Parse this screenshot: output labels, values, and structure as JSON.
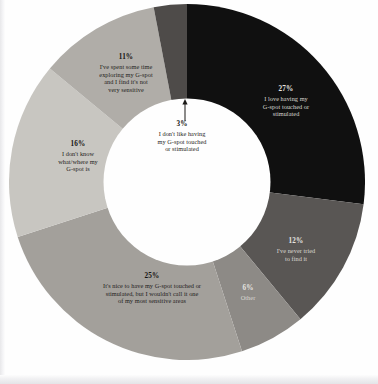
{
  "page": {
    "background_color": "#fefefe",
    "type": "scanned-book-page"
  },
  "chart_data": {
    "type": "pie",
    "variant": "donut",
    "title": "",
    "subtitle": "",
    "xlabel": "",
    "ylabel": "",
    "legend_position": "none",
    "labels_inside_slices": true,
    "start_angle_deg": 0,
    "direction": "clockwise",
    "inner_radius_ratio": 0.47,
    "units": "percent",
    "categories": [
      "I love having my G-spot touched or stimulated",
      "I've never tried to find it",
      "Other",
      "It's nice to have my G-spot touched or stimulated, but I wouldn't call it one of my most sensitive areas",
      "I don't know what/where my G-spot is",
      "I've spent some time exploring my G-spot and I find it's not very sensitive",
      "I don't like having my G-spot touched or stimulated"
    ],
    "values": [
      27,
      12,
      6,
      25,
      16,
      11,
      3
    ],
    "colors": [
      "#101010",
      "#595654",
      "#8d8a86",
      "#a3a09b",
      "#c8c6c1",
      "#b0ada8",
      "#4e4b49"
    ],
    "slices": [
      {
        "id": "slice-love",
        "percent_label": "27%",
        "value": 27,
        "lines": [
          "I love having my",
          "G-spot touched or",
          "stimulated"
        ],
        "color": "#101010",
        "text_color": "#d9d7d2"
      },
      {
        "id": "slice-never-tried",
        "percent_label": "12%",
        "value": 12,
        "lines": [
          "I've never tried",
          "to find it"
        ],
        "color": "#595654",
        "text_color": "#cfcdc9"
      },
      {
        "id": "slice-other",
        "percent_label": "6%",
        "value": 6,
        "lines": [
          "Other"
        ],
        "color": "#8d8a86",
        "text_color": "#ebeae7"
      },
      {
        "id": "slice-nice",
        "percent_label": "25%",
        "value": 25,
        "lines": [
          "It's nice to have my G-spot touched or",
          "stimulated, but I wouldn't call it one",
          "of my most sensitive areas"
        ],
        "color": "#a3a09b",
        "text_color": "#1f1d1b"
      },
      {
        "id": "slice-dont-know",
        "percent_label": "16%",
        "value": 16,
        "lines": [
          "I don't know",
          "what/where my",
          "G-spot is"
        ],
        "color": "#c8c6c1",
        "text_color": "#1f1d1b"
      },
      {
        "id": "slice-not-sensitive",
        "percent_label": "11%",
        "value": 11,
        "lines": [
          "I've spent some time",
          "exploring my G-spot",
          "and I find it's not",
          "very sensitive"
        ],
        "color": "#b0ada8",
        "text_color": "#1f1d1b"
      },
      {
        "id": "slice-dont-like",
        "percent_label": "3%",
        "value": 3,
        "lines": [
          "I don't like having",
          "my G-spot touched",
          "or stimulated"
        ],
        "color": "#4e4b49",
        "text_color": "#1f1d1b",
        "callout": true,
        "callout_icon": "up-arrow-icon"
      }
    ]
  },
  "labels": {
    "love": {
      "pct": "27%",
      "desc": "I love having my\nG-spot touched or\nstimulated"
    },
    "never_tried": {
      "pct": "12%",
      "desc": "I've never tried\nto find it"
    },
    "other": {
      "pct": "6%",
      "desc": "Other"
    },
    "nice": {
      "pct": "25%",
      "desc": "It's nice to have my G-spot touched or\nstimulated, but I wouldn't call it one\nof my most sensitive areas"
    },
    "dont_know": {
      "pct": "16%",
      "desc": "I don't know\nwhat/where my\nG-spot is"
    },
    "not_sensitive": {
      "pct": "11%",
      "desc": "I've spent some time\nexploring my G-spot\nand I find it's not\nvery sensitive"
    },
    "dont_like": {
      "pct": "3%",
      "desc": "I don't like having\nmy G-spot touched\nor stimulated"
    }
  }
}
